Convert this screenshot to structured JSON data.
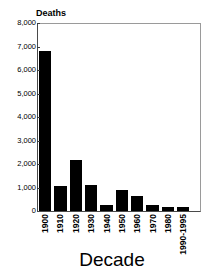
{
  "chart_data": {
    "type": "bar",
    "title": "",
    "xlabel": "Decade",
    "ylabel": "Deaths",
    "categories": [
      "1900",
      "1910",
      "1920",
      "1930",
      "1940",
      "1950",
      "1960",
      "1970",
      "1980",
      "1990-1995"
    ],
    "values": [
      6800,
      1050,
      2170,
      1120,
      250,
      900,
      620,
      270,
      160,
      150
    ],
    "ylim": [
      0,
      8000
    ],
    "ytick_labels": [
      "8,000",
      "7,000",
      "6,000",
      "5,000",
      "4,000",
      "3,000",
      "2,000",
      "1,000",
      "0"
    ],
    "ytick_values": [
      8000,
      7000,
      6000,
      5000,
      4000,
      3000,
      2000,
      1000,
      0
    ],
    "grid": false,
    "legend": false,
    "bar_color": "#000000",
    "frame_color": "#9a9a9a",
    "axis_color": "#4a4a4a",
    "background": "#ffffff"
  }
}
